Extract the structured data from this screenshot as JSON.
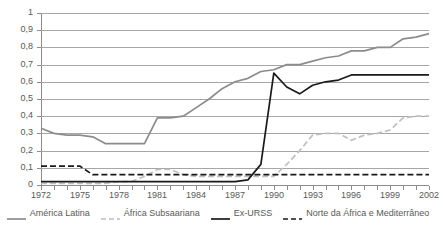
{
  "chart_data": {
    "type": "line",
    "title": "",
    "subtitle": "",
    "xlabel": "",
    "ylabel": "",
    "xlim": [
      1972,
      2002
    ],
    "ylim": [
      0,
      1
    ],
    "grid": true,
    "legend_position": "bottom",
    "x": [
      1972,
      1973,
      1974,
      1975,
      1976,
      1977,
      1978,
      1979,
      1980,
      1981,
      1982,
      1983,
      1984,
      1985,
      1986,
      1987,
      1988,
      1989,
      1990,
      1991,
      1992,
      1993,
      1994,
      1995,
      1996,
      1997,
      1998,
      1999,
      2000,
      2001,
      2002
    ],
    "x_tick_labels": [
      "1972",
      "1975",
      "1978",
      "1981",
      "1984",
      "1987",
      "1990",
      "1993",
      "1996",
      "1999",
      "2002"
    ],
    "x_tick_values": [
      1972,
      1975,
      1978,
      1981,
      1984,
      1987,
      1990,
      1993,
      1996,
      1999,
      2002
    ],
    "y_tick_labels": [
      "0",
      "0,1",
      "0,2",
      "0,3",
      "0,4",
      "0,5",
      "0,6",
      "0,7",
      "0,8",
      "0,9",
      "1"
    ],
    "y_tick_values": [
      0,
      0.1,
      0.2,
      0.3,
      0.4,
      0.5,
      0.6,
      0.7,
      0.8,
      0.9,
      1
    ],
    "series": [
      {
        "name": "América Latina",
        "color": "#8c8c8c",
        "style": "solid",
        "values": [
          0.33,
          0.3,
          0.29,
          0.29,
          0.28,
          0.24,
          0.24,
          0.24,
          0.24,
          0.39,
          0.39,
          0.4,
          0.45,
          0.5,
          0.56,
          0.6,
          0.62,
          0.66,
          0.67,
          0.7,
          0.7,
          0.72,
          0.74,
          0.75,
          0.78,
          0.78,
          0.8,
          0.8,
          0.85,
          0.86,
          0.88
        ]
      },
      {
        "name": "África Subsaariana",
        "color": "#bfbfbf",
        "style": "dashed",
        "values": [
          0.01,
          0.01,
          0.01,
          0.01,
          0.01,
          0.01,
          0.02,
          0.02,
          0.05,
          0.09,
          0.09,
          0.06,
          0.05,
          0.05,
          0.05,
          0.05,
          0.05,
          0.05,
          0.05,
          0.12,
          0.2,
          0.29,
          0.3,
          0.3,
          0.26,
          0.29,
          0.3,
          0.32,
          0.39,
          0.4,
          0.4
        ]
      },
      {
        "name": "Ex-URSS",
        "color": "#1a1a1a",
        "style": "solid",
        "values": [
          0.02,
          0.02,
          0.02,
          0.02,
          0.02,
          0.02,
          0.02,
          0.02,
          0.02,
          0.02,
          0.02,
          0.02,
          0.02,
          0.02,
          0.02,
          0.02,
          0.03,
          0.12,
          0.65,
          0.57,
          0.53,
          0.58,
          0.6,
          0.61,
          0.64,
          0.64,
          0.64,
          0.64,
          0.64,
          0.64,
          0.64
        ]
      },
      {
        "name": "Norte da África e Mediterrâneo",
        "color": "#1a1a1a",
        "style": "dashed",
        "values": [
          0.11,
          0.11,
          0.11,
          0.11,
          0.06,
          0.06,
          0.06,
          0.06,
          0.06,
          0.06,
          0.06,
          0.06,
          0.06,
          0.06,
          0.06,
          0.06,
          0.06,
          0.06,
          0.06,
          0.06,
          0.06,
          0.06,
          0.06,
          0.06,
          0.06,
          0.06,
          0.06,
          0.06,
          0.06,
          0.06,
          0.06
        ]
      }
    ]
  },
  "legend": {
    "items": [
      {
        "label": "América Latina",
        "icon": "solid-line-swatch-icon"
      },
      {
        "label": "África Subsaariana",
        "icon": "dashed-line-swatch-icon"
      },
      {
        "label": "Ex-URSS",
        "icon": "solid-line-swatch-icon"
      },
      {
        "label": "Norte da África e Mediterrâneo",
        "icon": "dashed-line-swatch-icon"
      }
    ]
  }
}
